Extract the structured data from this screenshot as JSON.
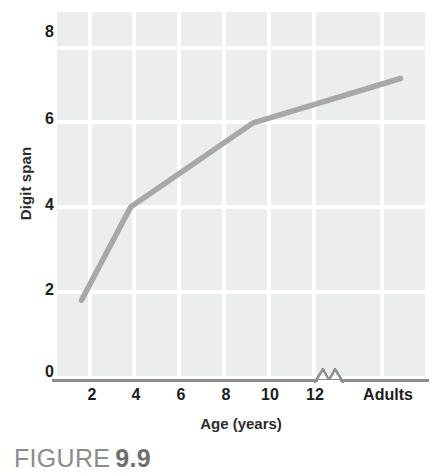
{
  "figure": {
    "caption_word": "FIGURE",
    "caption_number": "9.9"
  },
  "colors": {
    "plot_background": "#eceded",
    "gridline": "#ffffff",
    "line_series": "#a8a8a8",
    "axis_line": "#8e8e8e",
    "tick_text": "#1d1d1d",
    "axis_title_text": "#2b2b2b",
    "caption_text": "#8c8c8c"
  },
  "chart_data": {
    "type": "line",
    "title": "",
    "subtitle": "",
    "xlabel": "Age (years)",
    "ylabel": "Digit span",
    "x": [
      2,
      4,
      9,
      15
    ],
    "values": [
      1.8,
      3.9,
      5.8,
      6.8
    ],
    "series": [
      {
        "name": "Digit span",
        "x": [
          2,
          4,
          9,
          15
        ],
        "values": [
          1.8,
          3.9,
          5.8,
          6.8
        ]
      }
    ],
    "xtick_labels": [
      "2",
      "4",
      "6",
      "8",
      "10",
      "12",
      "Adults"
    ],
    "xtick_values": [
      2,
      4,
      6,
      8,
      10,
      12,
      15
    ],
    "ytick_labels": [
      "8",
      "6",
      "4",
      "2",
      "0"
    ],
    "ytick_values": [
      8,
      6,
      4,
      2,
      0
    ],
    "xlim": [
      1,
      16
    ],
    "ylim": [
      0,
      8.3
    ],
    "grid": true,
    "legend": "none",
    "axis_break": {
      "present": true,
      "position_label": "between 12 and Adults",
      "glyph": "zigzag"
    },
    "annotations": []
  },
  "y_axis": {
    "title": "Digit span",
    "ticks": [
      {
        "label": "8",
        "top": 24
      },
      {
        "label": "6",
        "top": 111
      },
      {
        "label": "4",
        "top": 197
      },
      {
        "label": "2",
        "top": 282
      },
      {
        "label": "0",
        "top": 364
      }
    ]
  },
  "x_axis": {
    "title": "Age (years)",
    "ticks": [
      {
        "label": "2",
        "left": 78,
        "width": 28
      },
      {
        "label": "4",
        "left": 122,
        "width": 28
      },
      {
        "label": "6",
        "left": 167,
        "width": 28
      },
      {
        "label": "8",
        "left": 212,
        "width": 28
      },
      {
        "label": "10",
        "left": 253,
        "width": 34
      },
      {
        "label": "12",
        "left": 298,
        "width": 34
      },
      {
        "label": "Adults",
        "left": 355,
        "width": 66
      }
    ]
  },
  "gridlines": {
    "horizontal_tops": [
      34,
      108,
      193,
      278,
      364
    ],
    "vertical_lefts": [
      31,
      75,
      120,
      165,
      210,
      255,
      323
    ]
  }
}
